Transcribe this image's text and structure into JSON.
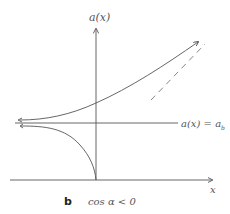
{
  "figure": {
    "panel_label": "b",
    "condition": "cos α < 0",
    "y_axis_label": "a(x)",
    "x_axis_label": "x",
    "asymptote_label": "a(x) = a_b",
    "asymptote_label_display": "a(x) = a",
    "asymptote_subscript": "b"
  },
  "colors": {
    "line": "#555555",
    "dashed": "#777777",
    "background": "#ffffff"
  }
}
